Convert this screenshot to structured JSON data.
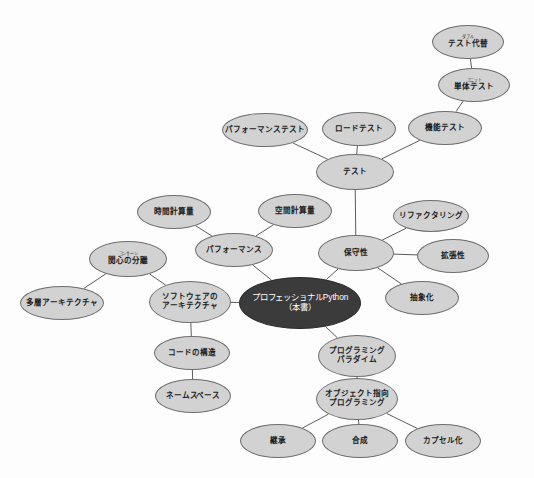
{
  "diagram": {
    "type": "mind-map",
    "background_color": "#fdfdfd",
    "node_fill": "#d2d2d2",
    "node_stroke": "#6d6d6d",
    "root_fill": "#3b3b3b",
    "root_text_color": "#ffffff",
    "edge_color": "#4a4a4a"
  },
  "nodes": [
    {
      "id": "root",
      "label": "プロフェッショナルPython",
      "label2": "（本書）",
      "ruby": "",
      "cx": 300,
      "cy": 303,
      "rx": 61,
      "ry": 26,
      "root": true
    },
    {
      "id": "test",
      "label": "テスト",
      "label2": "",
      "ruby": "",
      "cx": 355,
      "cy": 172,
      "rx": 39,
      "ry": 18,
      "root": false
    },
    {
      "id": "perf_test",
      "label": "パフォーマンステスト",
      "label2": "",
      "ruby": "",
      "cx": 265,
      "cy": 130,
      "rx": 43,
      "ry": 17,
      "root": false
    },
    {
      "id": "load_test",
      "label": "ロードテスト",
      "label2": "",
      "ruby": "",
      "cx": 359,
      "cy": 129,
      "rx": 37,
      "ry": 17,
      "root": false
    },
    {
      "id": "func_test",
      "label": "機能テスト",
      "label2": "",
      "ruby": "",
      "cx": 445,
      "cy": 128,
      "rx": 37,
      "ry": 17,
      "root": false
    },
    {
      "id": "unit_test",
      "label": "単体テスト",
      "label2": "",
      "ruby": "ユニット",
      "cx": 474,
      "cy": 85,
      "rx": 36,
      "ry": 17,
      "root": false
    },
    {
      "id": "test_double",
      "label": "テスト代替",
      "label2": "",
      "ruby": "ダブル",
      "cx": 468,
      "cy": 42,
      "rx": 36,
      "ry": 17,
      "root": false
    },
    {
      "id": "maintain",
      "label": "保守性",
      "label2": "",
      "ruby": "",
      "cx": 356,
      "cy": 253,
      "rx": 38,
      "ry": 18,
      "root": false
    },
    {
      "id": "refactor",
      "label": "リファクタリング",
      "label2": "",
      "ruby": "",
      "cx": 431,
      "cy": 216,
      "rx": 38,
      "ry": 16,
      "root": false
    },
    {
      "id": "extensible",
      "label": "拡張性",
      "label2": "",
      "ruby": "",
      "cx": 453,
      "cy": 256,
      "rx": 36,
      "ry": 17,
      "root": false
    },
    {
      "id": "abstraction",
      "label": "抽象化",
      "label2": "",
      "ruby": "",
      "cx": 422,
      "cy": 298,
      "rx": 37,
      "ry": 17,
      "root": false
    },
    {
      "id": "performance",
      "label": "パフォーマンス",
      "label2": "",
      "ruby": "",
      "cx": 234,
      "cy": 250,
      "rx": 39,
      "ry": 17,
      "root": false
    },
    {
      "id": "time_cx",
      "label": "時間計算量",
      "label2": "",
      "ruby": "",
      "cx": 174,
      "cy": 212,
      "rx": 37,
      "ry": 17,
      "root": false
    },
    {
      "id": "space_cx",
      "label": "空間計算量",
      "label2": "",
      "ruby": "",
      "cx": 295,
      "cy": 211,
      "rx": 37,
      "ry": 17,
      "root": false
    },
    {
      "id": "sw_arch",
      "label": "ソフトウェアの",
      "label2": "アーキテクチャ",
      "ruby": "",
      "cx": 190,
      "cy": 302,
      "rx": 41,
      "ry": 21,
      "root": false
    },
    {
      "id": "soc",
      "label": "関心の分離",
      "label2": "",
      "ruby": "コンサーン",
      "cx": 128,
      "cy": 259,
      "rx": 39,
      "ry": 18,
      "root": false
    },
    {
      "id": "layered",
      "label": "多層アーキテクチャ",
      "label2": "",
      "ruby": "",
      "cx": 62,
      "cy": 303,
      "rx": 42,
      "ry": 17,
      "root": false
    },
    {
      "id": "code_struct",
      "label": "コードの構造",
      "label2": "",
      "ruby": "",
      "cx": 192,
      "cy": 353,
      "rx": 38,
      "ry": 17,
      "root": false
    },
    {
      "id": "namespace",
      "label": "ネームスペース",
      "label2": "",
      "ruby": "",
      "cx": 193,
      "cy": 396,
      "rx": 38,
      "ry": 17,
      "root": false
    },
    {
      "id": "paradigm",
      "label": "プログラミング",
      "label2": "パラダイム",
      "ruby": "",
      "cx": 357,
      "cy": 356,
      "rx": 39,
      "ry": 21,
      "root": false
    },
    {
      "id": "oop",
      "label": "オブジェクト指向",
      "label2": "プログラミング",
      "ruby": "",
      "cx": 357,
      "cy": 399,
      "rx": 41,
      "ry": 21,
      "root": false
    },
    {
      "id": "inherit",
      "label": "継承",
      "label2": "",
      "ruby": "",
      "cx": 278,
      "cy": 441,
      "rx": 38,
      "ry": 17,
      "root": false
    },
    {
      "id": "composition",
      "label": "合成",
      "label2": "",
      "ruby": "",
      "cx": 360,
      "cy": 441,
      "rx": 38,
      "ry": 17,
      "root": false
    },
    {
      "id": "encapsulate",
      "label": "カプセル化",
      "label2": "",
      "ruby": "",
      "cx": 443,
      "cy": 441,
      "rx": 38,
      "ry": 17,
      "root": false
    }
  ],
  "edges": [
    {
      "from": "test_double",
      "to": "unit_test"
    },
    {
      "from": "unit_test",
      "to": "func_test"
    },
    {
      "from": "func_test",
      "to": "test"
    },
    {
      "from": "load_test",
      "to": "test"
    },
    {
      "from": "perf_test",
      "to": "test"
    },
    {
      "from": "test",
      "to": "maintain"
    },
    {
      "from": "refactor",
      "to": "maintain"
    },
    {
      "from": "extensible",
      "to": "maintain"
    },
    {
      "from": "abstraction",
      "to": "maintain"
    },
    {
      "from": "maintain",
      "to": "root"
    },
    {
      "from": "root",
      "to": "paradigm"
    },
    {
      "from": "paradigm",
      "to": "oop"
    },
    {
      "from": "oop",
      "to": "inherit"
    },
    {
      "from": "oop",
      "to": "composition"
    },
    {
      "from": "oop",
      "to": "encapsulate"
    },
    {
      "from": "root",
      "to": "sw_arch"
    },
    {
      "from": "sw_arch",
      "to": "soc"
    },
    {
      "from": "soc",
      "to": "layered"
    },
    {
      "from": "sw_arch",
      "to": "code_struct"
    },
    {
      "from": "code_struct",
      "to": "namespace"
    },
    {
      "from": "performance",
      "to": "root"
    },
    {
      "from": "time_cx",
      "to": "performance"
    },
    {
      "from": "space_cx",
      "to": "performance"
    }
  ]
}
